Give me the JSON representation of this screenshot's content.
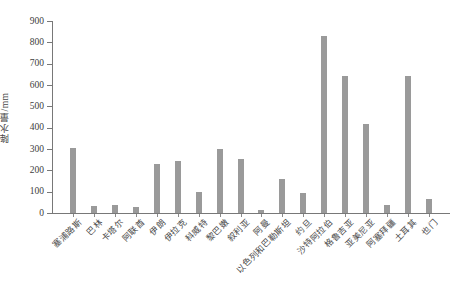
{
  "chart_data": {
    "type": "bar",
    "title": "",
    "xlabel": "",
    "ylabel": "降水量/mm",
    "ylim": [
      0,
      900
    ],
    "ytick_step": 100,
    "grid": false,
    "legend": "none",
    "bar_color": "#9a9a9a",
    "axis_color": "#787878",
    "ytick_labels": [
      "0",
      "100",
      "200",
      "300",
      "400",
      "500",
      "600",
      "700",
      "800",
      "900"
    ],
    "categories": [
      "塞浦路斯",
      "巴林",
      "卡塔尔",
      "阿联酋",
      "伊朗",
      "伊拉克",
      "科威特",
      "黎巴嫩",
      "叙利亚",
      "阿曼",
      "以色列和巴勒斯坦",
      "约旦",
      "沙特阿拉伯",
      "格鲁吉亚",
      "亚美尼亚",
      "阿塞拜疆",
      "土耳其",
      "也门"
    ],
    "values": [
      305,
      35,
      38,
      30,
      232,
      245,
      100,
      300,
      255,
      12,
      160,
      93,
      830,
      640,
      415,
      38,
      640,
      65
    ]
  }
}
